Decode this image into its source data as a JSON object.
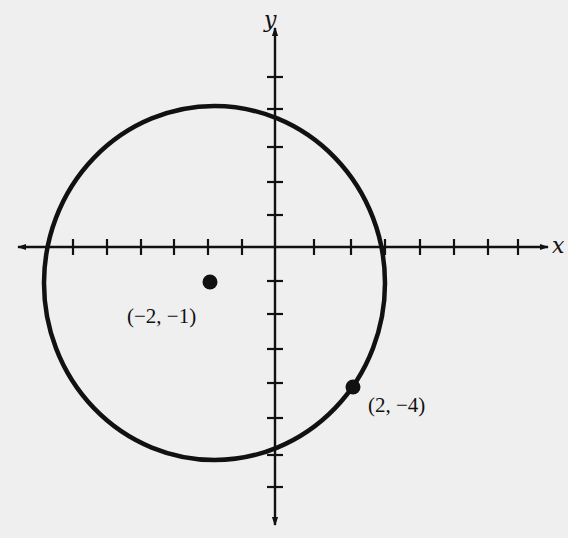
{
  "chart_data": {
    "type": "scatter",
    "title": "",
    "xlabel": "x",
    "ylabel": "y",
    "grid": false,
    "xlim": [
      -7,
      8
    ],
    "ylim": [
      -8,
      7
    ],
    "x_ticks": [
      -6,
      -5,
      -4,
      -3,
      -2,
      -1,
      1,
      2,
      3,
      4,
      5,
      6,
      7
    ],
    "y_ticks": [
      -7,
      -6,
      -5,
      -4,
      -3,
      -2,
      -1,
      1,
      2,
      3,
      4,
      5
    ],
    "tick_labels_shown": false,
    "circle": {
      "center": [
        -2,
        -1
      ],
      "radius": 5,
      "through_point": [
        2,
        -4
      ]
    },
    "points": [
      {
        "x": -2,
        "y": -1,
        "label": "(−2, −1)"
      },
      {
        "x": 2,
        "y": -4,
        "label": "(2, −4)"
      }
    ]
  },
  "colors": {
    "background": "#efefef",
    "ink": "#111111"
  },
  "render": {
    "origin": [
      275,
      247
    ],
    "x_tick_px": [
      73,
      107,
      141,
      174,
      208,
      242,
      314,
      351,
      385,
      420,
      454,
      488,
      518
    ],
    "y_tick_px": [
      77,
      109,
      147,
      182,
      215,
      281,
      314,
      349,
      383,
      418,
      455,
      487
    ],
    "x_axis_range_px": [
      18,
      548
    ],
    "y_axis_range_px": [
      28,
      525
    ],
    "circle_px": {
      "cx": 214.5,
      "cy": 283,
      "rx": 170.5,
      "ry": 177
    },
    "points_px": [
      {
        "cx": 210,
        "cy": 282,
        "label_x": 127,
        "label_y": 323
      },
      {
        "cx": 353,
        "cy": 387,
        "label_x": 368,
        "label_y": 412
      }
    ],
    "x_label_pos": [
      552,
      253
    ],
    "y_label_pos": [
      264,
      27
    ]
  }
}
